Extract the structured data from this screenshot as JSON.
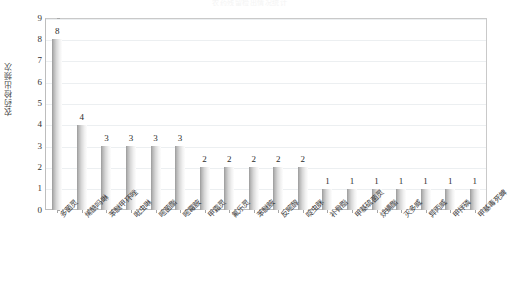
{
  "chart_data": {
    "type": "bar",
    "title": "农药残留检出情况统计",
    "xlabel": "",
    "ylabel": "农药检出频次",
    "ylim": [
      0,
      9
    ],
    "ytick_values": [
      0,
      1,
      2,
      3,
      4,
      5,
      6,
      7,
      8,
      9
    ],
    "grid": true,
    "legend": null,
    "categories": [
      "多菌灵",
      "烯酰吗啉",
      "苯醚甲环唑",
      "吡虫啉",
      "嘧菌酯",
      "嘧霉胺",
      "甲霜灵",
      "氟乐灵",
      "苯醚胺",
      "反嘧醇",
      "啶虫脒",
      "补骨脂",
      "甲基硫菌灵",
      "炔螨酯",
      "灭多威",
      "异丙威",
      "甲拌磷",
      "甲基毒死蜱"
    ],
    "values": [
      8,
      4,
      3,
      3,
      3,
      3,
      2,
      2,
      2,
      2,
      2,
      1,
      1,
      1,
      1,
      1,
      1,
      1
    ],
    "data_labels": [
      "8",
      "4",
      "3",
      "3",
      "3",
      "3",
      "2",
      "2",
      "2",
      "2",
      "2",
      "1",
      "1",
      "1",
      "1",
      "1",
      "1",
      "1"
    ],
    "colors": {
      "bar_gradient_start": "#9a9a9a",
      "bar_gradient_end": "#fdfdfd",
      "gridline": "#eceff1",
      "axis_line": "#bdbdbd",
      "text": "#333333",
      "background": "#ffffff"
    }
  }
}
